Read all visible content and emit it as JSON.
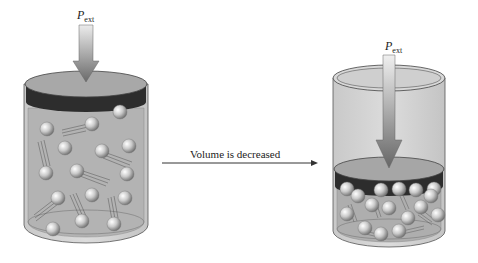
{
  "diagram": {
    "left_panel": {
      "label_main": "P",
      "label_sub": "ext",
      "state": "before"
    },
    "right_panel": {
      "label_main": "P",
      "label_sub": "ext",
      "state": "after"
    },
    "transition": {
      "caption": "Volume is decreased"
    },
    "colors": {
      "cylinder_fill": "#b8b8b8",
      "cylinder_wall": "#d6d6d6",
      "piston_top": "#a9a9a9",
      "piston_band": "#2b2b2b",
      "arrow_dark": "#6f6f6f",
      "arrow_light": "#e4e4e4",
      "molecule": "#c8c8c8",
      "caption_arrow": "#333333"
    }
  }
}
